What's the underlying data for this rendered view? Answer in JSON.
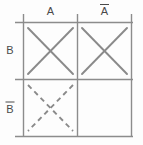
{
  "diagram": {
    "type": "karnaugh-map",
    "grid": {
      "rows": 2,
      "cols": 2,
      "line_color": "#8c8c8c",
      "background_color": "#fdfdfd",
      "label_color": "#4a4a4a"
    },
    "column_headers": [
      {
        "id": "col-a",
        "label": "A",
        "overbar": false
      },
      {
        "id": "col-a-not",
        "label": "A",
        "overbar": true
      }
    ],
    "row_headers": [
      {
        "id": "row-b",
        "label": "B",
        "overbar": false
      },
      {
        "id": "row-b-not",
        "label": "B",
        "overbar": true
      }
    ],
    "cells": [
      {
        "id": "cell-a-b",
        "row": "B",
        "col": "A",
        "mark": "x",
        "style": "solid"
      },
      {
        "id": "cell-anot-b",
        "row": "B",
        "col": "A-bar",
        "mark": "x",
        "style": "solid"
      },
      {
        "id": "cell-a-bnot",
        "row": "B-bar",
        "col": "A",
        "mark": "x",
        "style": "dashed"
      },
      {
        "id": "cell-anot-bnot",
        "row": "B-bar",
        "col": "A-bar",
        "mark": "none",
        "style": "none"
      }
    ]
  }
}
